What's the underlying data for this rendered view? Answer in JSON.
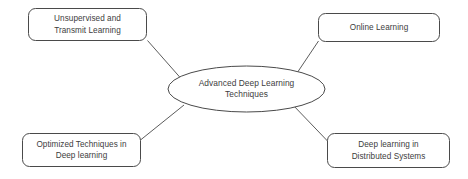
{
  "diagram": {
    "type": "mind-map",
    "background_color": "#ffffff",
    "stroke_color": "#4a4a4a",
    "text_color": "#3d3d3d",
    "center": {
      "shape": "ellipse",
      "label": "Advanced Deep Learning\nTechniques",
      "line1": "Advanced Deep Learning",
      "line2": "Techniques"
    },
    "nodes": [
      {
        "id": "unsupervised-and-transmit-learning",
        "shape": "rounded-rectangle",
        "label": "Unsupervised and\nTransmit Learning",
        "line1": "Unsupervised and",
        "line2": "Transmit Learning",
        "position": "top-left"
      },
      {
        "id": "online-learning",
        "shape": "rounded-rectangle",
        "label": "Online Learning",
        "line1": "Online Learning",
        "line2": "",
        "position": "top-right"
      },
      {
        "id": "optimized-techniques-in-deep-learning",
        "shape": "rounded-rectangle",
        "label": "Optimized Techniques in\nDeep learning",
        "line1": "Optimized Techniques in",
        "line2": "Deep learning",
        "position": "bottom-left"
      },
      {
        "id": "deep-learning-in-distributed-systems",
        "shape": "rounded-rectangle",
        "label": "Deep learning in\nDistributed Systems",
        "line1": "Deep learning in",
        "line2": "Distributed Systems",
        "position": "bottom-right"
      }
    ],
    "connectors": [
      {
        "from": "unsupervised-and-transmit-learning",
        "to": "center"
      },
      {
        "from": "online-learning",
        "to": "center"
      },
      {
        "from": "optimized-techniques-in-deep-learning",
        "to": "center"
      },
      {
        "from": "deep-learning-in-distributed-systems",
        "to": "center"
      }
    ]
  }
}
